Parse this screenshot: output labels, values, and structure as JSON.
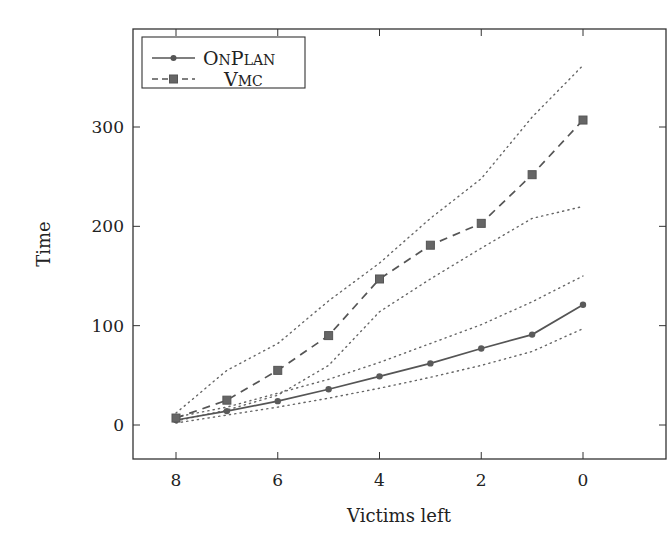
{
  "chart_data": {
    "type": "line",
    "title": "",
    "xlabel": "Victims left",
    "ylabel": "Time",
    "x": [
      8,
      7,
      6,
      5,
      4,
      3,
      2,
      1,
      0
    ],
    "xlim": [
      8.85,
      -1.65
    ],
    "ylim": [
      -33,
      400
    ],
    "x_ticks": [
      8,
      6,
      4,
      2,
      0
    ],
    "y_ticks": [
      0,
      100,
      200,
      300
    ],
    "x_reversed": true,
    "grid": false,
    "legend_position": "upper left",
    "series": [
      {
        "name": "OnPlan",
        "style": "solid",
        "marker": "circle",
        "color": "#555555",
        "values": [
          5,
          14,
          24,
          36,
          49,
          62,
          77,
          91,
          121
        ],
        "upper_bound": [
          8,
          18,
          32,
          46,
          63,
          82,
          101,
          124,
          150
        ],
        "lower_bound": [
          2,
          10,
          18,
          27,
          37,
          48,
          60,
          74,
          97
        ]
      },
      {
        "name": "Vmc",
        "style": "dashed",
        "marker": "square",
        "color": "#555555",
        "values": [
          7,
          25,
          55,
          90,
          147,
          181,
          203,
          252,
          307
        ],
        "upper_bound": [
          12,
          55,
          82,
          125,
          163,
          208,
          248,
          310,
          362
        ],
        "lower_bound": [
          4,
          15,
          30,
          60,
          114,
          147,
          178,
          208,
          220
        ]
      }
    ]
  },
  "legend": {
    "items": [
      {
        "label_first": "O",
        "label_small": "N",
        "label_first2": "P",
        "label_small2": "LAN"
      },
      {
        "label_first": "V",
        "label_small": "MC",
        "label_first2": "",
        "label_small2": ""
      }
    ]
  }
}
